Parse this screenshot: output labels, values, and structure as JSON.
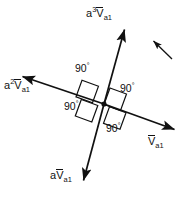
{
  "diagram": {
    "background_color": "#ffffff",
    "stroke_color": "#111111",
    "vectors": [
      {
        "id": "v-a1",
        "name": "V-a1",
        "coefficient": "",
        "exponent": "",
        "base": "V",
        "subscript": "a1",
        "label_plain": "Va1",
        "direction_deg": 29,
        "tip": [
          178,
          131
        ],
        "origin": [
          104,
          104
        ]
      },
      {
        "id": "a-v-a1",
        "name": "a-V-a1",
        "coefficient": "a",
        "exponent": "",
        "base": "V",
        "subscript": "a1",
        "label_plain": "aVa1",
        "direction_deg": 119,
        "tip": [
          82,
          185
        ],
        "origin": [
          104,
          104
        ]
      },
      {
        "id": "a2-v-a1",
        "name": "a2-V-a1",
        "coefficient": "a",
        "exponent": "2",
        "base": "V",
        "subscript": "a1",
        "label_plain": "a2Va1",
        "direction_deg": 209,
        "tip": [
          19,
          75
        ],
        "origin": [
          104,
          104
        ]
      },
      {
        "id": "a3-v-a1",
        "name": "a3-V-a1",
        "coefficient": "a",
        "exponent": "3",
        "base": "V",
        "subscript": "a1",
        "label_plain": "a3Va1",
        "direction_deg": 299,
        "tip": [
          126,
          25
        ],
        "origin": [
          104,
          104
        ]
      }
    ],
    "angle_marks": [
      {
        "id": "angle-top-left",
        "value": "90",
        "unit": "°"
      },
      {
        "id": "angle-right",
        "value": "90",
        "unit": "°"
      },
      {
        "id": "angle-bottom-left",
        "value": "90",
        "unit": "°"
      },
      {
        "id": "angle-bottom",
        "value": "90",
        "unit": "°"
      }
    ],
    "rotation_indicator": {
      "id": "rotation-arrow",
      "description": "short arrow indicating direction of rotation",
      "from": [
        172,
        59
      ],
      "to": [
        151,
        39
      ]
    },
    "center_point": {
      "id": "origin-dot",
      "coords": [
        104,
        104
      ]
    }
  }
}
